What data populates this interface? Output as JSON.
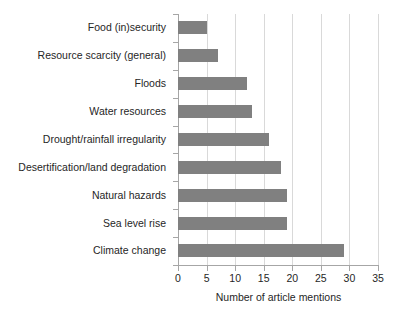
{
  "chart_data": {
    "type": "bar",
    "orientation": "horizontal",
    "title": "",
    "xlabel": "Number of article mentions",
    "ylabel": "",
    "xlim": [
      0,
      35
    ],
    "xticks": [
      0,
      5,
      10,
      15,
      20,
      25,
      30,
      35
    ],
    "grid": "vertical",
    "legend": "none",
    "bar_color": "#808080",
    "gridline_color": "#d9d9d9",
    "axis_color": "#a6a6a6",
    "categories": [
      "Food (in)security",
      "Resource scarcity (general)",
      "Floods",
      "Water resources",
      "Drought/rainfall irregularity",
      "Desertification/land degradation",
      "Natural hazards",
      "Sea level rise",
      "Climate change"
    ],
    "values": [
      5,
      7,
      12,
      13,
      16,
      18,
      19,
      19,
      29
    ]
  }
}
